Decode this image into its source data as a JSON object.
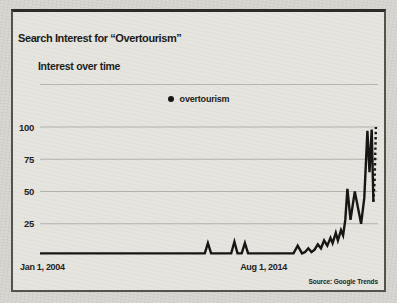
{
  "header": {
    "title": "Search Interest for “Overtourism”"
  },
  "chart_data": {
    "type": "line",
    "title": "Interest over time",
    "legend": {
      "label": "overtourism",
      "marker_color": "#171614"
    },
    "x_axis": {
      "range_years": [
        2004,
        2020
      ],
      "ticks": [
        {
          "label": "Jan 1, 2004",
          "year": 2004.0,
          "align": "start"
        },
        {
          "label": "Aug 1, 2014",
          "year": 2014.58,
          "align": "middle"
        }
      ]
    },
    "y_axis": {
      "range": [
        0,
        100
      ],
      "ticks": [
        100,
        75,
        50,
        25
      ]
    },
    "grid": true,
    "line_color": "#171614",
    "grid_color": "#b3b1aa",
    "series": [
      {
        "name": "overtourism",
        "points": [
          [
            2004.0,
            2
          ],
          [
            2005.0,
            2
          ],
          [
            2006.0,
            2
          ],
          [
            2007.0,
            2
          ],
          [
            2008.0,
            2
          ],
          [
            2009.0,
            2
          ],
          [
            2010.0,
            2
          ],
          [
            2011.0,
            2
          ],
          [
            2011.8,
            2
          ],
          [
            2011.95,
            10
          ],
          [
            2012.1,
            2
          ],
          [
            2013.05,
            2
          ],
          [
            2013.2,
            11
          ],
          [
            2013.35,
            2
          ],
          [
            2013.55,
            2
          ],
          [
            2013.7,
            10
          ],
          [
            2013.85,
            2
          ],
          [
            2014.5,
            2
          ],
          [
            2015.5,
            2
          ],
          [
            2016.0,
            2
          ],
          [
            2016.2,
            8
          ],
          [
            2016.4,
            2
          ],
          [
            2016.55,
            3
          ],
          [
            2016.7,
            6
          ],
          [
            2016.85,
            3
          ],
          [
            2017.0,
            5
          ],
          [
            2017.15,
            9
          ],
          [
            2017.3,
            6
          ],
          [
            2017.45,
            12
          ],
          [
            2017.6,
            8
          ],
          [
            2017.75,
            14
          ],
          [
            2017.85,
            10
          ],
          [
            2018.0,
            18
          ],
          [
            2018.1,
            12
          ],
          [
            2018.25,
            20
          ],
          [
            2018.35,
            16
          ],
          [
            2018.45,
            28
          ],
          [
            2018.55,
            52
          ],
          [
            2018.7,
            28
          ],
          [
            2018.9,
            50
          ],
          [
            2019.2,
            25
          ],
          [
            2019.35,
            45
          ],
          [
            2019.5,
            97
          ],
          [
            2019.6,
            65
          ],
          [
            2019.7,
            98
          ],
          [
            2019.78,
            42
          ]
        ],
        "dotted_tail": [
          [
            2019.78,
            42
          ],
          [
            2019.84,
            58
          ],
          [
            2019.9,
            100
          ]
        ]
      }
    ],
    "source": "Source: Google Trends"
  }
}
